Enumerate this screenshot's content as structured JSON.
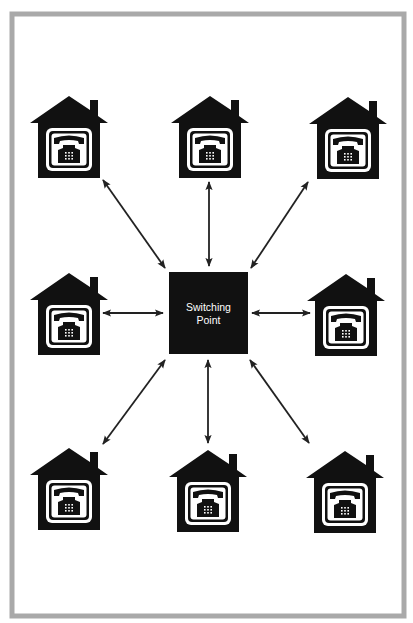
{
  "diagram": {
    "title": "",
    "hub": {
      "label_line1": "Switching",
      "label_line2": "Point",
      "x": 169,
      "y": 272,
      "width": 79,
      "height": 82
    },
    "nodes": [
      {
        "id": "house-top-left",
        "label": "telephone subscriber",
        "x": 30,
        "y": 96
      },
      {
        "id": "house-top-center",
        "label": "telephone subscriber",
        "x": 171,
        "y": 96
      },
      {
        "id": "house-top-right",
        "label": "telephone subscriber",
        "x": 308,
        "y": 97
      },
      {
        "id": "house-middle-left",
        "label": "telephone subscriber",
        "x": 30,
        "y": 273
      },
      {
        "id": "house-middle-right",
        "label": "telephone subscriber",
        "x": 307,
        "y": 274
      },
      {
        "id": "house-bottom-left",
        "label": "telephone subscriber",
        "x": 30,
        "y": 448
      },
      {
        "id": "house-bottom-center",
        "label": "telephone subscriber",
        "x": 169,
        "y": 450
      },
      {
        "id": "house-bottom-right",
        "label": "telephone subscriber",
        "x": 306,
        "y": 451
      }
    ],
    "connections": [
      {
        "from": "house-top-left",
        "to": "hub",
        "type": "bidirectional"
      },
      {
        "from": "house-top-center",
        "to": "hub",
        "type": "bidirectional"
      },
      {
        "from": "house-top-right",
        "to": "hub",
        "type": "bidirectional"
      },
      {
        "from": "house-middle-left",
        "to": "hub",
        "type": "bidirectional"
      },
      {
        "from": "house-middle-right",
        "to": "hub",
        "type": "bidirectional"
      },
      {
        "from": "house-bottom-left",
        "to": "hub",
        "type": "bidirectional"
      },
      {
        "from": "house-bottom-center",
        "to": "hub",
        "type": "bidirectional"
      },
      {
        "from": "house-bottom-right",
        "to": "hub",
        "type": "bidirectional"
      }
    ],
    "icons": {
      "node_icon": "house-with-telephone-icon",
      "edge_icon": "double-headed-arrow"
    },
    "colors": {
      "ink": "#111111",
      "frame": "#a9a9a9",
      "background": "#ffffff"
    }
  }
}
